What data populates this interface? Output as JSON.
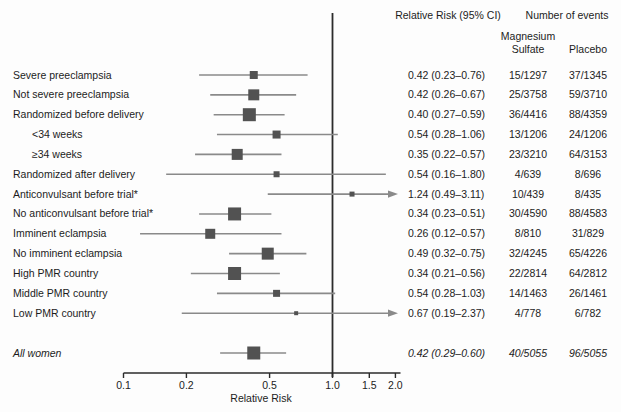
{
  "header": {
    "rr_col": "Relative Risk (95% CI)",
    "events_col": "Number of events",
    "group1_line1": "Magnesium",
    "group1_line2": "Sulfate",
    "group2": "Placebo"
  },
  "axis": {
    "label": "Relative Risk",
    "ticks": [
      0.1,
      0.2,
      0.5,
      1.0,
      1.5,
      2.0
    ],
    "tick_labels": [
      "0.1",
      "0.2",
      "0.5",
      "1.0",
      "1.5",
      "2.0"
    ],
    "scale": "log",
    "range": [
      0.1,
      2.0
    ],
    "reference_line": 1.0
  },
  "colors": {
    "marker": "#525252",
    "ci_line": "#8a8a8a",
    "axis_line": "#2b2b2b",
    "text": "#1c1c1c"
  },
  "chart_data": {
    "type": "forest",
    "title": "",
    "xlabel": "Relative Risk",
    "xscale": "log",
    "xticks": [
      0.1,
      0.2,
      0.5,
      1.0,
      1.5,
      2.0
    ],
    "reference_line": 1.0,
    "rows": [
      {
        "label": "Severe preeclampsia",
        "indent": false,
        "italic": false,
        "rr": 0.42,
        "lo": 0.23,
        "hi": 0.76,
        "rr_text": "0.42 (0.23–0.76)",
        "mg": "15/1297",
        "placebo": "37/1345",
        "weight": 8,
        "arrow": false
      },
      {
        "label": "Not severe preeclampsia",
        "indent": false,
        "italic": false,
        "rr": 0.42,
        "lo": 0.26,
        "hi": 0.67,
        "rr_text": "0.42 (0.26–0.67)",
        "mg": "25/3758",
        "placebo": "59/3710",
        "weight": 11,
        "arrow": false
      },
      {
        "label": "Randomized before delivery",
        "indent": false,
        "italic": false,
        "rr": 0.4,
        "lo": 0.27,
        "hi": 0.59,
        "rr_text": "0.40 (0.27–0.59)",
        "mg": "36/4416",
        "placebo": "88/4359",
        "weight": 13,
        "arrow": false
      },
      {
        "label": "<34 weeks",
        "indent": true,
        "italic": false,
        "rr": 0.54,
        "lo": 0.28,
        "hi": 1.06,
        "rr_text": "0.54 (0.28–1.06)",
        "mg": "13/1206",
        "placebo": "24/1206",
        "weight": 8,
        "arrow": false
      },
      {
        "label": "≥34 weeks",
        "indent": true,
        "italic": false,
        "rr": 0.35,
        "lo": 0.22,
        "hi": 0.57,
        "rr_text": "0.35 (0.22–0.57)",
        "mg": "23/3210",
        "placebo": "64/3153",
        "weight": 11,
        "arrow": false
      },
      {
        "label": "Randomized after delivery",
        "indent": false,
        "italic": false,
        "rr": 0.54,
        "lo": 0.16,
        "hi": 1.8,
        "rr_text": "0.54 (0.16–1.80)",
        "mg": "4/639",
        "placebo": "8/696",
        "weight": 6,
        "arrow": false
      },
      {
        "label": "Anticonvulsant before trial*",
        "indent": false,
        "italic": false,
        "rr": 1.24,
        "lo": 0.49,
        "hi": 3.11,
        "rr_text": "1.24 (0.49–3.11)",
        "mg": "10/439",
        "placebo": "8/435",
        "weight": 5,
        "arrow": true
      },
      {
        "label": "No anticonvulsant before trial*",
        "indent": false,
        "italic": false,
        "rr": 0.34,
        "lo": 0.23,
        "hi": 0.51,
        "rr_text": "0.34 (0.23–0.51)",
        "mg": "30/4590",
        "placebo": "88/4583",
        "weight": 13,
        "arrow": false
      },
      {
        "label": "Imminent eclampsia",
        "indent": false,
        "italic": false,
        "rr": 0.26,
        "lo": 0.12,
        "hi": 0.57,
        "rr_text": "0.26 (0.12–0.57)",
        "mg": "8/810",
        "placebo": "31/829",
        "weight": 10,
        "arrow": false
      },
      {
        "label": "No imminent eclampsia",
        "indent": false,
        "italic": false,
        "rr": 0.49,
        "lo": 0.32,
        "hi": 0.75,
        "rr_text": "0.49 (0.32–0.75)",
        "mg": "32/4245",
        "placebo": "65/4226",
        "weight": 12,
        "arrow": false
      },
      {
        "label": "High PMR country",
        "indent": false,
        "italic": false,
        "rr": 0.34,
        "lo": 0.21,
        "hi": 0.56,
        "rr_text": "0.34 (0.21–0.56)",
        "mg": "22/2814",
        "placebo": "64/2812",
        "weight": 13,
        "arrow": false
      },
      {
        "label": "Middle PMR country",
        "indent": false,
        "italic": false,
        "rr": 0.54,
        "lo": 0.28,
        "hi": 1.03,
        "rr_text": "0.54 (0.28–1.03)",
        "mg": "14/1463",
        "placebo": "26/1461",
        "weight": 7,
        "arrow": false
      },
      {
        "label": "Low PMR country",
        "indent": false,
        "italic": false,
        "rr": 0.67,
        "lo": 0.19,
        "hi": 2.37,
        "rr_text": "0.67 (0.19–2.37)",
        "mg": "4/778",
        "placebo": "6/782",
        "weight": 4,
        "arrow": true
      },
      {
        "label": "All women",
        "indent": false,
        "italic": true,
        "rr": 0.42,
        "lo": 0.29,
        "hi": 0.6,
        "rr_text": "0.42 (0.29–0.60)",
        "mg": "40/5055",
        "placebo": "96/5055",
        "weight": 13,
        "arrow": false
      }
    ]
  }
}
